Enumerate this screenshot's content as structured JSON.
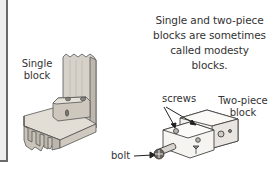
{
  "caption": {
    "line1": "Single and two-piece",
    "line2": "blocks are sometimes",
    "line3": "called modesty blocks."
  },
  "labels": {
    "single_block_l1": "Single",
    "single_block_l2": "block",
    "two_piece_l1": "Two-piece",
    "two_piece_l2": "block",
    "screws": "screws",
    "bolt": "bolt"
  },
  "colors": {
    "wood": "#d9d4cc",
    "wood_dark": "#a9a39a",
    "outline": "#555555",
    "panel_border": "#6a6a6a",
    "panel_bg": "#eeeeee"
  }
}
